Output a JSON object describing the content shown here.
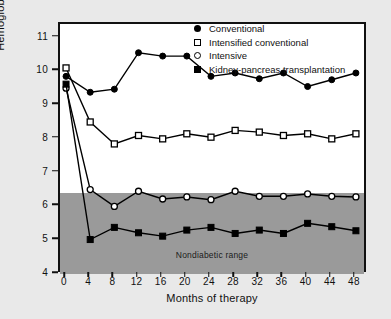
{
  "chart_data": {
    "type": "line",
    "title": "",
    "xlabel": "Months of therapy",
    "ylabel": "Hemoglobin A1c, %",
    "ylabel_display": "Hemoglobin A",
    "ylabel_sub": "1c",
    "ylabel_tail": ", %",
    "x": [
      0,
      4,
      8,
      12,
      16,
      20,
      24,
      28,
      32,
      36,
      40,
      44,
      48
    ],
    "xlim": [
      -1,
      50
    ],
    "ylim": [
      4,
      11.4
    ],
    "xticks": [
      "0",
      "4",
      "8",
      "12",
      "16",
      "20",
      "24",
      "28",
      "32",
      "36",
      "40",
      "44",
      "48"
    ],
    "yticks": [
      "4",
      "5",
      "6",
      "7",
      "8",
      "9",
      "10",
      "11"
    ],
    "grid": false,
    "legend_position": "top-right",
    "annotations": [
      {
        "text": "Nondiabetic range",
        "y": 4.55,
        "x": 26
      }
    ],
    "shaded_band": {
      "label": "Nondiabetic range",
      "y_min": 4.0,
      "y_max": 6.4,
      "color": "#9a9a9a"
    },
    "series": [
      {
        "name": "Conventional",
        "marker": "filled-circle",
        "color": "#000000",
        "values": [
          9.85,
          9.38,
          9.47,
          10.55,
          10.45,
          10.45,
          9.85,
          9.95,
          9.78,
          9.95,
          9.55,
          9.75,
          9.95
        ]
      },
      {
        "name": "Intensified conventional",
        "marker": "open-square",
        "color": "#000000",
        "values": [
          10.1,
          8.5,
          7.85,
          8.1,
          8.0,
          8.15,
          8.05,
          8.25,
          8.2,
          8.1,
          8.15,
          8.0,
          8.15
        ]
      },
      {
        "name": "Intensive",
        "marker": "open-circle",
        "color": "#000000",
        "values": [
          9.5,
          6.5,
          6.0,
          6.45,
          6.22,
          6.28,
          6.2,
          6.45,
          6.3,
          6.3,
          6.37,
          6.3,
          6.28
        ]
      },
      {
        "name": "Kidney-pancreas transplantation",
        "marker": "filled-square",
        "color": "#000000",
        "values": [
          9.62,
          5.02,
          5.38,
          5.22,
          5.12,
          5.3,
          5.38,
          5.2,
          5.3,
          5.2,
          5.5,
          5.4,
          5.28
        ]
      }
    ]
  },
  "legend": {
    "items": [
      {
        "label": "Conventional",
        "marker": "filled-circle"
      },
      {
        "label": "Intensified conventional",
        "marker": "open-square"
      },
      {
        "label": "Intensive",
        "marker": "open-circle"
      },
      {
        "label": "Kidney-pancreas transplantation",
        "marker": "filled-square"
      }
    ]
  }
}
